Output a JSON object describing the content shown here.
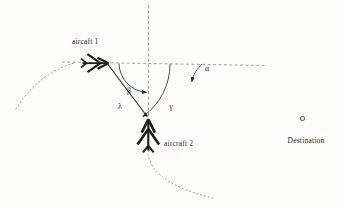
{
  "colors": {
    "paper": "#fdfdfb",
    "ink": "#1f1f1f",
    "guide": "#8e8e8e"
  },
  "diagram": {
    "aircraft1": {
      "label": "aircaft 1"
    },
    "aircraft2": {
      "label": "aircraft 2"
    },
    "destination": {
      "label": "Destination"
    },
    "angles": {
      "alpha": "α",
      "beta": "β",
      "gamma": "γ"
    },
    "distance": {
      "lambda": "λ"
    },
    "icons": {
      "aircraft": "jet-arrow-silhouette",
      "destination": "small-outline-circle",
      "arrowhead": "filled-triangle-marker"
    }
  }
}
